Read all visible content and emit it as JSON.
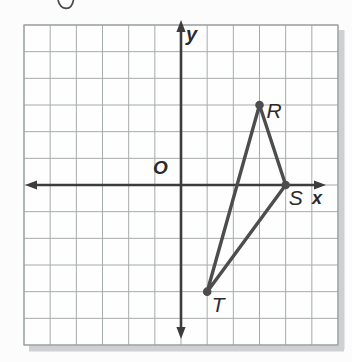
{
  "figure": {
    "type": "coordinate-plane-triangle",
    "axis_labels": {
      "x": "x",
      "y": "y",
      "origin": "O"
    },
    "grid": {
      "columns": 12,
      "rows": 12,
      "x_range": [
        -6,
        6
      ],
      "y_range": [
        -6,
        6
      ],
      "axes_through_center": true,
      "gridlines_visible": true
    },
    "triangle": {
      "name": "RST",
      "vertices": [
        {
          "label": "R",
          "x": 3,
          "y": 3,
          "label_dx": 7,
          "label_dy": 13
        },
        {
          "label": "S",
          "x": 4,
          "y": 0,
          "label_dx": 3,
          "label_dy": 20
        },
        {
          "label": "T",
          "x": 1,
          "y": -4,
          "label_dx": 4.5,
          "label_dy": 20
        }
      ]
    },
    "colors": {
      "background": "#fcfcfc",
      "plot_background": "#fefefe",
      "grid_line": "#a6abab",
      "grid_border": "#9aa0a0",
      "axis": "#3c3c3c",
      "triangle": "#4d4d4d",
      "vertex_dot": "#4d4d4d",
      "shadow": "#cdd1d1",
      "label_text": "#2b2b2b"
    }
  }
}
